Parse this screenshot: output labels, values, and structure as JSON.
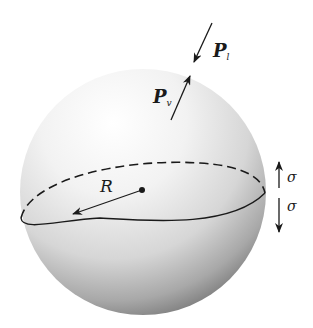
{
  "figure": {
    "labels": {
      "p_outer": "P",
      "p_outer_sub": "l",
      "p_inner": "P",
      "p_inner_sub": "v",
      "radius": "R",
      "sigma_up": "σ",
      "sigma_down": "σ"
    },
    "colors": {
      "sphere_highlight": "#ffffff",
      "sphere_shadow": "#6e6e6e",
      "line": "#1a1a1a"
    }
  }
}
